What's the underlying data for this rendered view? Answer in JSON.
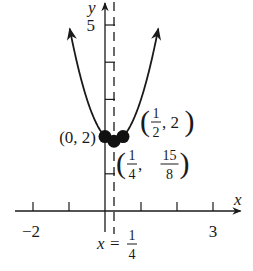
{
  "chart_data": {
    "type": "line",
    "title": "",
    "xlabel": "x",
    "ylabel": "y",
    "xlim": [
      -2.1,
      3.6
    ],
    "ylim": [
      -0.6,
      5.4
    ],
    "grid": false,
    "x_ticks": [
      -2,
      -1,
      0,
      1,
      2,
      3
    ],
    "x_tick_labels": [
      {
        "value": -2,
        "label": "−2"
      },
      {
        "value": 3,
        "label": "3"
      }
    ],
    "y_ticks": [
      1,
      2,
      3,
      4,
      5
    ],
    "y_tick_labels": [
      {
        "value": 5,
        "label": "5"
      }
    ],
    "series": [
      {
        "name": "parabola",
        "equation": "y = 2x^2 - x + 2",
        "coefficients": {
          "a": 2,
          "b": -1,
          "c": 2
        },
        "x_range": [
          -0.98,
          1.48
        ]
      }
    ],
    "axis_of_symmetry": {
      "x": 0.25,
      "label_left": "x =",
      "label_num": "1",
      "label_den": "4"
    },
    "points": [
      {
        "x": 0,
        "y": 2,
        "label": "(0, 2)"
      },
      {
        "x": 0.25,
        "y": 1.875,
        "label": "(1/4, 15/8)",
        "x_num": "1",
        "x_den": "4",
        "y_num": "15",
        "y_den": "8"
      },
      {
        "x": 0.5,
        "y": 2,
        "label": "(1/2, 2)",
        "x_num": "1",
        "x_den": "2",
        "y_val": "2"
      }
    ]
  }
}
